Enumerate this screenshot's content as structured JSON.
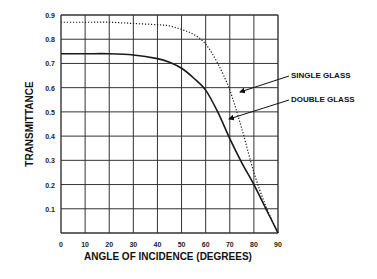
{
  "chart_data": {
    "type": "line",
    "title": "",
    "xlabel": "ANGLE OF INCIDENCE (DEGREES)",
    "ylabel": "TRANSMITTANCE",
    "xlim": [
      0,
      90
    ],
    "ylim": [
      0,
      0.9
    ],
    "grid": true,
    "x_ticks": [
      "0",
      "10",
      "20",
      "30",
      "40",
      "50",
      "60",
      "70",
      "80",
      "90"
    ],
    "y_ticks": [
      "0.1",
      "0.2",
      "0.3",
      "0.4",
      "0.5",
      "0.6",
      "0.7",
      "0.8",
      "0.9"
    ],
    "legend_position": "right, annotated with arrows",
    "series": [
      {
        "name": "SINGLE GLASS",
        "style": "dotted",
        "x": [
          0,
          10,
          20,
          30,
          40,
          45,
          50,
          55,
          60,
          65,
          70,
          75,
          80,
          85,
          90
        ],
        "y": [
          0.87,
          0.87,
          0.87,
          0.865,
          0.86,
          0.855,
          0.84,
          0.82,
          0.78,
          0.7,
          0.59,
          0.43,
          0.25,
          0.11,
          0.0
        ]
      },
      {
        "name": "DOUBLE GLASS",
        "style": "solid",
        "x": [
          0,
          10,
          20,
          30,
          40,
          45,
          50,
          55,
          60,
          65,
          70,
          75,
          80,
          85,
          90
        ],
        "y": [
          0.74,
          0.74,
          0.74,
          0.735,
          0.72,
          0.705,
          0.68,
          0.64,
          0.59,
          0.5,
          0.39,
          0.29,
          0.2,
          0.1,
          0.0
        ]
      }
    ]
  }
}
